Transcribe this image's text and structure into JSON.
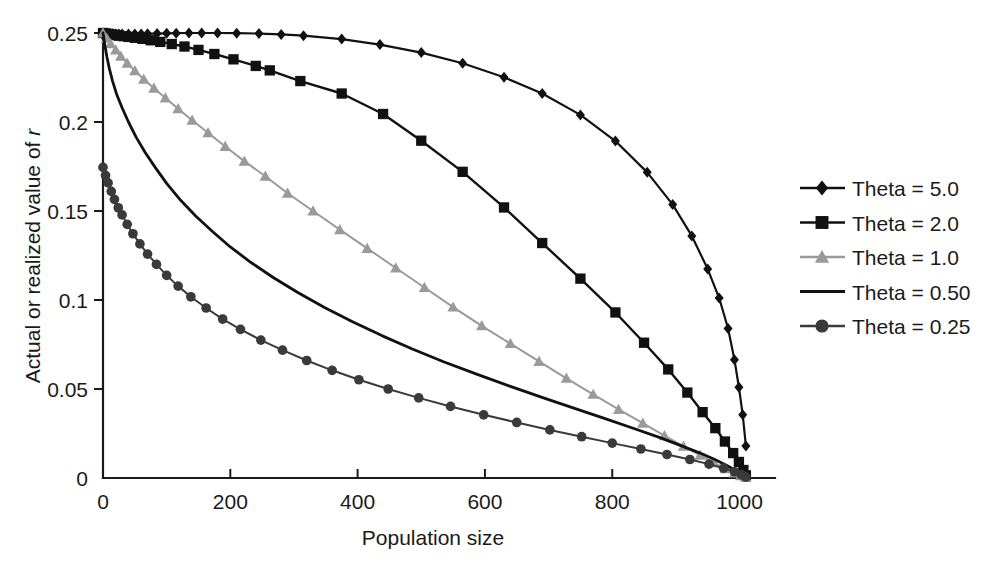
{
  "chart_data": {
    "type": "line",
    "title": "",
    "xlabel": "Population size",
    "ylabel": "Actual or realized value of r",
    "ylabel_italic_suffix": "r",
    "xlim": [
      0,
      1040
    ],
    "ylim": [
      0,
      0.25
    ],
    "xticks": [
      0,
      200,
      400,
      600,
      800,
      1000
    ],
    "xtick_labels": [
      "0",
      "200",
      "400",
      "600",
      "800",
      "1000"
    ],
    "yticks": [
      0,
      0.05,
      0.1,
      0.15,
      0.2,
      0.25
    ],
    "ytick_labels": [
      "0",
      "0.05",
      "0.1",
      "0.15",
      "0.2",
      "0.25"
    ],
    "grid": false,
    "legend_position": "right",
    "series": [
      {
        "name": "Theta = 5.0",
        "marker": "diamond",
        "color": "#111111",
        "line_width": 2.2,
        "marker_size": 11,
        "x": [
          0,
          5,
          10,
          15,
          20,
          25,
          30,
          40,
          50,
          60,
          70,
          85,
          100,
          115,
          135,
          155,
          180,
          210,
          245,
          280,
          315,
          375,
          435,
          500,
          565,
          630,
          690,
          750,
          805,
          855,
          895,
          925,
          950,
          968,
          982,
          992,
          999,
          1005,
          1010
        ],
        "y": [
          0.25,
          0.2498,
          0.2497,
          0.2496,
          0.2495,
          0.2495,
          0.2494,
          0.2494,
          0.2494,
          0.2495,
          0.2496,
          0.2497,
          0.2498,
          0.2499,
          0.25,
          0.25,
          0.25,
          0.2499,
          0.2497,
          0.2492,
          0.2485,
          0.2466,
          0.2435,
          0.239,
          0.233,
          0.2251,
          0.216,
          0.204,
          0.1893,
          0.1717,
          0.1536,
          0.136,
          0.1174,
          0.1011,
          0.084,
          0.0665,
          0.051,
          0.0355,
          0.018
        ]
      },
      {
        "name": "Theta = 2.0",
        "marker": "square",
        "color": "#111111",
        "line_width": 2.4,
        "marker_size": 12,
        "x": [
          0,
          5,
          10,
          15,
          20,
          25,
          32,
          40,
          50,
          62,
          75,
          90,
          108,
          128,
          150,
          175,
          205,
          240,
          262,
          310,
          375,
          440,
          500,
          565,
          630,
          690,
          750,
          805,
          850,
          888,
          918,
          942,
          962,
          977,
          990,
          999,
          1006,
          1010
        ],
        "y": [
          0.25,
          0.2497,
          0.2494,
          0.2491,
          0.2488,
          0.2485,
          0.2482,
          0.2478,
          0.2473,
          0.2467,
          0.2459,
          0.245,
          0.2438,
          0.2424,
          0.2405,
          0.2382,
          0.2352,
          0.2315,
          0.229,
          0.223,
          0.216,
          0.2045,
          0.1895,
          0.172,
          0.152,
          0.132,
          0.112,
          0.093,
          0.076,
          0.061,
          0.048,
          0.037,
          0.028,
          0.0205,
          0.014,
          0.009,
          0.0045,
          0.0015
        ]
      },
      {
        "name": "Theta = 1.0",
        "marker": "triangle",
        "color": "#9a9a9a",
        "line_width": 2.0,
        "marker_size": 12,
        "x": [
          0,
          6,
          12,
          20,
          28,
          38,
          50,
          64,
          80,
          98,
          118,
          140,
          165,
          192,
          222,
          255,
          290,
          330,
          372,
          415,
          460,
          505,
          550,
          595,
          640,
          685,
          728,
          770,
          810,
          848,
          882,
          912,
          938,
          960,
          978,
          992,
          1002,
          1010
        ],
        "y": [
          0.25,
          0.247,
          0.244,
          0.2405,
          0.237,
          0.233,
          0.2288,
          0.224,
          0.219,
          0.2135,
          0.2075,
          0.201,
          0.194,
          0.1862,
          0.178,
          0.1695,
          0.16,
          0.15,
          0.1395,
          0.129,
          0.118,
          0.107,
          0.096,
          0.0855,
          0.0755,
          0.0655,
          0.056,
          0.047,
          0.0385,
          0.0308,
          0.0238,
          0.0178,
          0.0128,
          0.0085,
          0.0052,
          0.0028,
          0.0012,
          0.0003
        ]
      },
      {
        "name": "Theta = 0.50",
        "marker": "none",
        "color": "#111111",
        "line_width": 2.8,
        "marker_size": 0,
        "x": [
          0,
          3,
          6,
          10,
          15,
          22,
          30,
          40,
          52,
          66,
          82,
          100,
          122,
          146,
          172,
          200,
          232,
          268,
          306,
          348,
          392,
          438,
          486,
          536,
          588,
          640,
          692,
          742,
          790,
          834,
          874,
          908,
          938,
          962,
          980,
          994,
          1004,
          1010
        ],
        "y": [
          0.25,
          0.243,
          0.2368,
          0.23,
          0.223,
          0.215,
          0.208,
          0.2,
          0.1915,
          0.183,
          0.1745,
          0.1655,
          0.156,
          0.147,
          0.1385,
          0.1298,
          0.1212,
          0.1125,
          0.1042,
          0.0958,
          0.0878,
          0.08,
          0.0725,
          0.0652,
          0.0582,
          0.0515,
          0.045,
          0.039,
          0.0332,
          0.0278,
          0.0228,
          0.0182,
          0.014,
          0.0102,
          0.007,
          0.0042,
          0.002,
          0.0005
        ]
      },
      {
        "name": "Theta = 0.25",
        "marker": "circle",
        "color": "#3a3a3a",
        "line_width": 2.0,
        "marker_size": 11,
        "x": [
          0,
          4,
          8,
          13,
          18,
          24,
          30,
          38,
          47,
          58,
          70,
          84,
          100,
          118,
          138,
          162,
          188,
          216,
          248,
          282,
          320,
          360,
          402,
          448,
          496,
          546,
          598,
          650,
          702,
          752,
          800,
          845,
          886,
          922,
          952,
          975,
          992,
          1003,
          1010
        ],
        "y": [
          0.1745,
          0.17,
          0.1658,
          0.161,
          0.1565,
          0.1518,
          0.1478,
          0.1425,
          0.1372,
          0.1315,
          0.1258,
          0.12,
          0.1138,
          0.1078,
          0.1018,
          0.0955,
          0.0893,
          0.0835,
          0.0775,
          0.0718,
          0.066,
          0.0605,
          0.0552,
          0.05,
          0.045,
          0.0402,
          0.0355,
          0.0312,
          0.027,
          0.0232,
          0.0196,
          0.0163,
          0.0132,
          0.0104,
          0.0078,
          0.0055,
          0.0035,
          0.0018,
          0.0005
        ]
      }
    ]
  },
  "legend": {
    "items": [
      {
        "label": "Theta = 5.0",
        "marker": "diamond",
        "color": "#111111"
      },
      {
        "label": "Theta = 2.0",
        "marker": "square",
        "color": "#111111"
      },
      {
        "label": "Theta = 1.0",
        "marker": "triangle",
        "color": "#9a9a9a"
      },
      {
        "label": "Theta = 0.50",
        "marker": "none",
        "color": "#111111"
      },
      {
        "label": "Theta = 0.25",
        "marker": "circle",
        "color": "#3a3a3a"
      }
    ]
  },
  "colors": {
    "background": "#ffffff",
    "axis": "#1a1a1a",
    "text": "#1a1a1a"
  }
}
